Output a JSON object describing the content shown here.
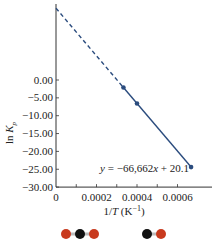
{
  "chart_data": {
    "type": "line",
    "title": "",
    "xlabel": "1/T (K⁻¹)",
    "ylabel": "ln Kp",
    "xlim": [
      0,
      0.00068
    ],
    "ylim": [
      -30,
      21
    ],
    "x_ticks": [
      0,
      0.0002,
      0.0004,
      0.0006
    ],
    "x_tick_labels": [
      "0",
      "0.0002",
      "0.0004",
      "0.0006"
    ],
    "y_ticks": [
      0,
      -5,
      -10,
      -15,
      -20,
      -25,
      -30
    ],
    "y_tick_labels": [
      "0.00",
      "−5.00",
      "−10.00",
      "−15.00",
      "−20.00",
      "−25.00",
      "−30.00"
    ],
    "fit": {
      "slope": -66662,
      "intercept": 20.1,
      "label_prefix": "y = ",
      "label": "−66,662x + 20.1"
    },
    "points": [
      {
        "x": 0.000333,
        "y": -2.1
      },
      {
        "x": 0.0004,
        "y": -6.6
      },
      {
        "x": 0.000667,
        "y": -24.4
      }
    ],
    "extrapolation": {
      "x_from": 0,
      "x_to": 0.000333,
      "style": "dashed"
    },
    "series_color": "#2b4c7e",
    "molecules": [
      {
        "name": "CO2",
        "atoms": [
          "O",
          "C",
          "O"
        ]
      },
      {
        "name": "CO",
        "atoms": [
          "C",
          "O"
        ]
      }
    ],
    "atom_colors": {
      "O": "#c83a1e",
      "C": "#111111"
    }
  }
}
